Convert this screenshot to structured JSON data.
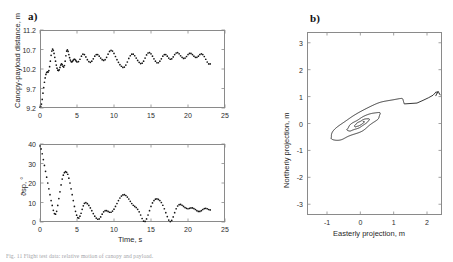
{
  "figure": {
    "panel_a_label": "a)",
    "panel_b_label": "b)",
    "caption": "Fig. 11  Flight test data: relative motion of canopy and payload."
  },
  "chart_data": [
    {
      "id": "canopy-payload-distance",
      "type": "scatter",
      "panel": "a-top",
      "title": "",
      "xlabel": "",
      "ylabel": "Canopy-payload distance, m",
      "xticks": [
        0,
        5,
        10,
        15,
        20,
        25
      ],
      "yticks": [
        9.2,
        9.7,
        10.2,
        10.7,
        11.2
      ],
      "xlim": [
        0,
        25
      ],
      "ylim": [
        9.2,
        11.2
      ],
      "grid": false,
      "legend": "none",
      "marker": "dot",
      "x": [
        0.0,
        0.1,
        0.2,
        0.3,
        0.4,
        0.5,
        0.6,
        0.7,
        0.8,
        0.9,
        1.0,
        1.1,
        1.2,
        1.3,
        1.4,
        1.5,
        1.6,
        1.7,
        1.8,
        1.9,
        2.0,
        2.1,
        2.2,
        2.3,
        2.4,
        2.5,
        2.6,
        2.7,
        2.8,
        2.9,
        3.0,
        3.1,
        3.2,
        3.3,
        3.4,
        3.5,
        3.6,
        3.7,
        3.8,
        3.9,
        4.0,
        4.1,
        4.2,
        4.3,
        4.4,
        4.5,
        4.6,
        4.7,
        4.8,
        4.9,
        5.0,
        5.2,
        5.4,
        5.6,
        5.8,
        6.0,
        6.2,
        6.4,
        6.6,
        6.8,
        7.0,
        7.2,
        7.4,
        7.6,
        7.8,
        8.0,
        8.2,
        8.4,
        8.6,
        8.8,
        9.0,
        9.2,
        9.4,
        9.6,
        9.8,
        10.0,
        10.2,
        10.4,
        10.6,
        10.8,
        11.0,
        11.2,
        11.4,
        11.6,
        11.8,
        12.0,
        12.2,
        12.4,
        12.6,
        12.8,
        13.0,
        13.2,
        13.4,
        13.6,
        13.8,
        14.0,
        14.2,
        14.4,
        14.6,
        14.8,
        15.0,
        15.2,
        15.4,
        15.6,
        15.8,
        16.0,
        16.2,
        16.4,
        16.6,
        16.8,
        17.0,
        17.2,
        17.4,
        17.6,
        17.8,
        18.0,
        18.2,
        18.4,
        18.6,
        18.8,
        19.0,
        19.2,
        19.4,
        19.6,
        19.8,
        20.0,
        20.2,
        20.4,
        20.6,
        20.8,
        21.0,
        21.2,
        21.4,
        21.6,
        21.8,
        22.0,
        22.2,
        22.4,
        22.6,
        22.8,
        23.0
      ],
      "y": [
        9.22,
        9.24,
        9.3,
        9.42,
        9.58,
        9.72,
        9.86,
        9.97,
        10.06,
        10.11,
        10.13,
        10.12,
        10.16,
        10.26,
        10.4,
        10.55,
        10.66,
        10.71,
        10.68,
        10.6,
        10.5,
        10.4,
        10.3,
        10.22,
        10.17,
        10.16,
        10.18,
        10.24,
        10.3,
        10.33,
        10.31,
        10.27,
        10.25,
        10.29,
        10.4,
        10.54,
        10.66,
        10.69,
        10.65,
        10.57,
        10.49,
        10.43,
        10.39,
        10.38,
        10.4,
        10.43,
        10.45,
        10.45,
        10.43,
        10.4,
        10.38,
        10.39,
        10.45,
        10.53,
        10.58,
        10.57,
        10.51,
        10.44,
        10.39,
        10.37,
        10.4,
        10.46,
        10.53,
        10.57,
        10.57,
        10.53,
        10.48,
        10.44,
        10.42,
        10.44,
        10.5,
        10.58,
        10.65,
        10.68,
        10.66,
        10.6,
        10.52,
        10.44,
        10.37,
        10.31,
        10.27,
        10.24,
        10.25,
        10.3,
        10.38,
        10.47,
        10.54,
        10.58,
        10.58,
        10.54,
        10.48,
        10.42,
        10.37,
        10.34,
        10.35,
        10.4,
        10.48,
        10.56,
        10.61,
        10.62,
        10.59,
        10.53,
        10.46,
        10.4,
        10.36,
        10.36,
        10.4,
        10.46,
        10.53,
        10.57,
        10.57,
        10.53,
        10.48,
        10.45,
        10.46,
        10.51,
        10.57,
        10.61,
        10.62,
        10.59,
        10.54,
        10.5,
        10.47,
        10.48,
        10.52,
        10.57,
        10.6,
        10.6,
        10.57,
        10.53,
        10.5,
        10.5,
        10.53,
        10.57,
        10.59,
        10.57,
        10.52,
        10.45,
        10.38,
        10.33,
        10.33
      ]
    },
    {
      "id": "relative-swing-angle",
      "type": "scatter",
      "panel": "a-bottom",
      "title": "",
      "xlabel": "Time, s",
      "ylabel": "ϑsp, °",
      "xticks": [
        0,
        5,
        10,
        15,
        20,
        25
      ],
      "yticks": [
        0,
        10,
        20,
        30,
        40
      ],
      "xlim": [
        0,
        25
      ],
      "ylim": [
        0,
        40
      ],
      "grid": false,
      "legend": "none",
      "marker": "dot",
      "x": [
        0.0,
        0.15,
        0.3,
        0.45,
        0.6,
        0.75,
        0.9,
        1.05,
        1.2,
        1.35,
        1.5,
        1.65,
        1.8,
        1.95,
        2.1,
        2.25,
        2.4,
        2.55,
        2.7,
        2.85,
        3.0,
        3.15,
        3.3,
        3.45,
        3.6,
        3.75,
        3.9,
        4.05,
        4.2,
        4.35,
        4.5,
        4.65,
        4.8,
        4.95,
        5.1,
        5.25,
        5.4,
        5.55,
        5.7,
        5.85,
        6.0,
        6.2,
        6.4,
        6.6,
        6.8,
        7.0,
        7.2,
        7.4,
        7.6,
        7.8,
        8.0,
        8.2,
        8.4,
        8.6,
        8.8,
        9.0,
        9.2,
        9.4,
        9.6,
        9.8,
        10.0,
        10.2,
        10.4,
        10.6,
        10.8,
        11.0,
        11.2,
        11.4,
        11.6,
        11.8,
        12.0,
        12.2,
        12.4,
        12.6,
        12.8,
        13.0,
        13.2,
        13.4,
        13.6,
        13.8,
        14.0,
        14.2,
        14.4,
        14.6,
        14.8,
        15.0,
        15.2,
        15.4,
        15.6,
        15.8,
        16.0,
        16.2,
        16.4,
        16.6,
        16.8,
        17.0,
        17.2,
        17.4,
        17.6,
        17.8,
        18.0,
        18.2,
        18.4,
        18.6,
        18.8,
        19.0,
        19.2,
        19.4,
        19.6,
        19.8,
        20.0,
        20.2,
        20.4,
        20.6,
        20.8,
        21.0,
        21.2,
        21.4,
        21.6,
        21.8,
        22.0,
        22.2,
        22.4,
        22.6,
        22.8,
        23.0
      ],
      "y": [
        39.0,
        37.5,
        35.0,
        32.0,
        29.0,
        26.0,
        23.0,
        20.0,
        17.0,
        14.0,
        11.0,
        8.5,
        6.0,
        4.3,
        4.0,
        5.5,
        8.5,
        12.0,
        15.5,
        19.0,
        22.0,
        24.0,
        25.3,
        25.8,
        25.5,
        24.5,
        22.5,
        20.0,
        17.0,
        14.0,
        11.0,
        8.0,
        5.5,
        3.5,
        2.2,
        2.0,
        3.0,
        4.5,
        6.5,
        8.3,
        9.6,
        9.9,
        9.4,
        8.5,
        7.2,
        5.8,
        4.3,
        3.0,
        2.0,
        1.4,
        1.6,
        2.6,
        4.0,
        5.2,
        5.8,
        5.8,
        5.4,
        5.0,
        5.0,
        5.6,
        6.6,
        8.0,
        9.5,
        11.0,
        12.3,
        13.3,
        13.9,
        14.0,
        13.6,
        12.8,
        11.8,
        10.6,
        9.5,
        8.6,
        8.0,
        7.4,
        6.5,
        5.2,
        3.6,
        1.8,
        0.4,
        0.3,
        1.6,
        3.6,
        5.8,
        8.0,
        9.8,
        11.0,
        11.7,
        11.9,
        11.6,
        11.0,
        10.0,
        8.6,
        6.8,
        4.8,
        2.8,
        1.0,
        0.2,
        0.8,
        2.6,
        4.8,
        6.8,
        8.2,
        8.9,
        9.0,
        8.6,
        8.0,
        7.4,
        7.0,
        6.8,
        7.0,
        7.2,
        7.2,
        6.9,
        6.4,
        5.8,
        5.4,
        5.4,
        5.8,
        6.4,
        6.9,
        7.0,
        6.8,
        6.4,
        6.2
      ]
    },
    {
      "id": "horizontal-projection-trajectory",
      "type": "line",
      "panel": "b",
      "title": "",
      "xlabel": "Easterly projection, m",
      "ylabel": "Northerly projection, m",
      "xticks": [
        -1,
        0,
        1,
        2
      ],
      "yticks": [
        -3,
        -2,
        -1,
        0,
        1,
        2,
        3
      ],
      "xlim": [
        -1.6,
        2.45
      ],
      "ylim": [
        -3.4,
        3.4
      ],
      "grid": false,
      "legend": "none",
      "marker": "line",
      "description": "Spiraling relative-motion trace collapsing toward the origin from a start near (2.3, 1.1)"
    }
  ]
}
